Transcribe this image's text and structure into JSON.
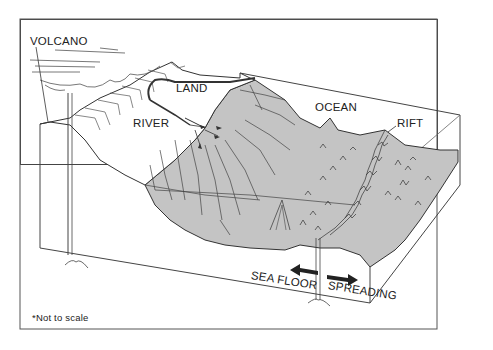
{
  "diagram": {
    "labels": {
      "volcano": "VOLCANO",
      "land": "LAND",
      "river": "RIVER",
      "ocean": "OCEAN",
      "rift": "RIFT",
      "sea_floor": "SEA FLOOR",
      "spreading": "SPREADING"
    },
    "footnote": "*Not to scale",
    "colors": {
      "seafloor_fill": "#c4c4c4",
      "line": "#333333",
      "background": "#ffffff"
    }
  }
}
